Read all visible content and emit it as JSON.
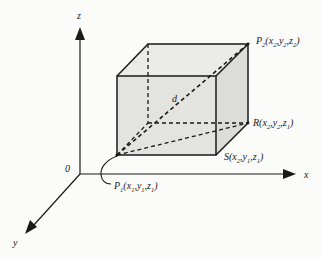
{
  "diagram": {
    "colors": {
      "background": "#fbfbf9",
      "line": "#1a1a1a",
      "face_fill": "#e2e2df",
      "top_fill": "#ebebe8",
      "side_fill": "#dcdcd9"
    },
    "axes": {
      "x_label": "x",
      "y_label": "y",
      "z_label": "z",
      "origin_label": "0"
    },
    "points": {
      "p1": {
        "name": "P",
        "sub": "1",
        "coords": "(x",
        "c1": "1",
        "sep1": ",y",
        "c2": "1",
        "sep2": ",z",
        "c3": "1",
        "close": ")"
      },
      "p2": {
        "name": "P",
        "sub": "2",
        "coords": "(x",
        "c1": "2",
        "sep1": ",y",
        "c2": "2",
        "sep2": ",z",
        "c3": "2",
        "close": ")"
      },
      "r": {
        "name": "R",
        "coords": "(x",
        "c1": "2",
        "sep1": ",y",
        "c2": "2",
        "sep2": ",z",
        "c3": "1",
        "close": ")"
      },
      "s": {
        "name": "S",
        "coords": "(x",
        "c1": "2",
        "sep1": ",y",
        "c2": "1",
        "sep2": ",z",
        "c3": "1",
        "close": ")"
      }
    },
    "distance_label": "d"
  }
}
